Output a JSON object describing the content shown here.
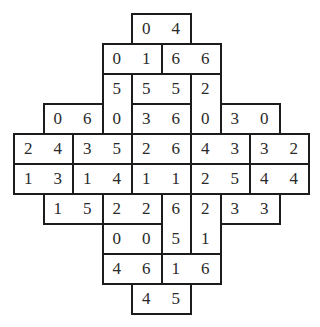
{
  "puzzle": {
    "type": "domino-grid",
    "cell_size": [
      29.5,
      30
    ],
    "origin": [
      14,
      14
    ],
    "line_color": "#1c1c1c",
    "text_color": "#2a2a2a",
    "dominoes": [
      {
        "row": 0,
        "col": 4,
        "orient": "h",
        "values": [
          "0",
          "4"
        ]
      },
      {
        "row": 1,
        "col": 3,
        "orient": "h",
        "values": [
          "0",
          "1"
        ]
      },
      {
        "row": 1,
        "col": 5,
        "orient": "h",
        "values": [
          "6",
          "6"
        ]
      },
      {
        "row": 2,
        "col": 3,
        "orient": "v",
        "values": [
          "5",
          "0"
        ]
      },
      {
        "row": 2,
        "col": 4,
        "orient": "h",
        "values": [
          "5",
          "5"
        ]
      },
      {
        "row": 2,
        "col": 6,
        "orient": "v",
        "values": [
          "2",
          "0"
        ]
      },
      {
        "row": 3,
        "col": 1,
        "orient": "h",
        "values": [
          "0",
          "6"
        ]
      },
      {
        "row": 3,
        "col": 4,
        "orient": "h",
        "values": [
          "3",
          "6"
        ]
      },
      {
        "row": 3,
        "col": 7,
        "orient": "h",
        "values": [
          "3",
          "0"
        ]
      },
      {
        "row": 4,
        "col": 0,
        "orient": "h",
        "values": [
          "2",
          "4"
        ]
      },
      {
        "row": 4,
        "col": 2,
        "orient": "h",
        "values": [
          "3",
          "5"
        ]
      },
      {
        "row": 4,
        "col": 4,
        "orient": "h",
        "values": [
          "2",
          "6"
        ]
      },
      {
        "row": 4,
        "col": 6,
        "orient": "h",
        "values": [
          "4",
          "3"
        ]
      },
      {
        "row": 4,
        "col": 8,
        "orient": "h",
        "values": [
          "3",
          "2"
        ]
      },
      {
        "row": 5,
        "col": 0,
        "orient": "h",
        "values": [
          "1",
          "3"
        ]
      },
      {
        "row": 5,
        "col": 2,
        "orient": "h",
        "values": [
          "1",
          "4"
        ]
      },
      {
        "row": 5,
        "col": 4,
        "orient": "h",
        "values": [
          "1",
          "1"
        ]
      },
      {
        "row": 5,
        "col": 6,
        "orient": "h",
        "values": [
          "2",
          "5"
        ]
      },
      {
        "row": 5,
        "col": 8,
        "orient": "h",
        "values": [
          "4",
          "4"
        ]
      },
      {
        "row": 6,
        "col": 1,
        "orient": "h",
        "values": [
          "1",
          "5"
        ]
      },
      {
        "row": 6,
        "col": 3,
        "orient": "h",
        "values": [
          "2",
          "2"
        ]
      },
      {
        "row": 6,
        "col": 5,
        "orient": "v",
        "values": [
          "6",
          "5"
        ]
      },
      {
        "row": 6,
        "col": 6,
        "orient": "v",
        "values": [
          "2",
          "1"
        ]
      },
      {
        "row": 6,
        "col": 7,
        "orient": "h",
        "values": [
          "3",
          "3"
        ]
      },
      {
        "row": 7,
        "col": 3,
        "orient": "h",
        "values": [
          "0",
          "0"
        ]
      },
      {
        "row": 8,
        "col": 3,
        "orient": "h",
        "values": [
          "4",
          "6"
        ]
      },
      {
        "row": 8,
        "col": 5,
        "orient": "h",
        "values": [
          "1",
          "6"
        ]
      },
      {
        "row": 9,
        "col": 4,
        "orient": "h",
        "values": [
          "4",
          "5"
        ]
      }
    ]
  }
}
